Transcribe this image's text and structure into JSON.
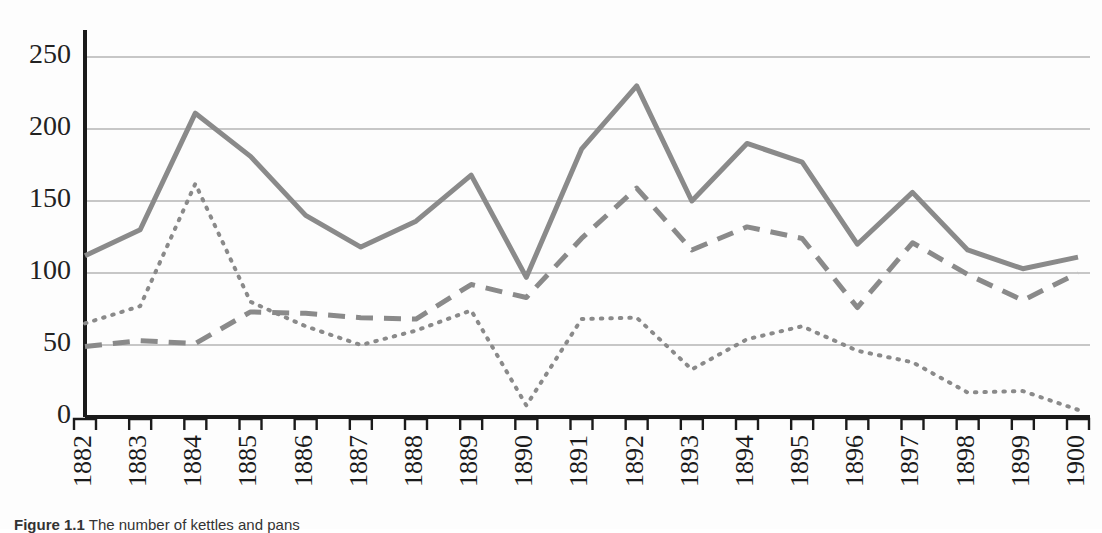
{
  "figure": {
    "caption_label": "Figure 1.1",
    "caption_text": "The number of kettles and pans"
  },
  "axes": {
    "y_ticks": [
      "0",
      "50",
      "100",
      "150",
      "200",
      "250"
    ],
    "x_ticks": [
      "1882",
      "1883",
      "1884",
      "1885",
      "1886",
      "1887",
      "1888",
      "1889",
      "1890",
      "1891",
      "1892",
      "1893",
      "1894",
      "1895",
      "1896",
      "1897",
      "1898",
      "1899",
      "1900"
    ],
    "gridline_color": "#b4b4b4",
    "axis_color": "#1a1a1a"
  },
  "style": {
    "line_color": "#8a8a8a",
    "background": "#fdfdfd"
  },
  "chart_data": {
    "type": "line",
    "title": "",
    "xlabel": "",
    "ylabel": "",
    "ylim": [
      0,
      265
    ],
    "yticks": [
      0,
      50,
      100,
      150,
      200,
      250
    ],
    "grid": true,
    "legend": "none",
    "categories": [
      1882,
      1883,
      1884,
      1885,
      1886,
      1887,
      1888,
      1889,
      1890,
      1891,
      1892,
      1893,
      1894,
      1895,
      1896,
      1897,
      1898,
      1899,
      1900
    ],
    "series": [
      {
        "name": "solid-series",
        "style": "solid",
        "color": "#8a8a8a",
        "width": 5,
        "values": [
          112,
          130,
          211,
          181,
          140,
          118,
          136,
          168,
          97,
          186,
          230,
          150,
          190,
          177,
          120,
          156,
          116,
          103,
          111
        ]
      },
      {
        "name": "dashed-series",
        "style": "dashed",
        "color": "#8a8a8a",
        "width": 5,
        "values": [
          49,
          53,
          51,
          73,
          72,
          69,
          68,
          92,
          83,
          124,
          159,
          116,
          132,
          124,
          76,
          121,
          99,
          81,
          100
        ]
      },
      {
        "name": "dotted-series",
        "style": "dotted",
        "color": "#8a8a8a",
        "width": 4,
        "values": [
          65,
          77,
          162,
          80,
          63,
          50,
          60,
          74,
          8,
          68,
          69,
          33,
          54,
          63,
          46,
          38,
          17,
          18,
          5
        ]
      }
    ]
  }
}
